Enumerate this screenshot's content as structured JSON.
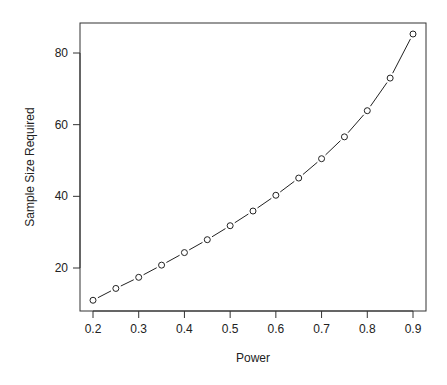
{
  "chart_data": {
    "type": "line",
    "title": "",
    "xlabel": "Power",
    "ylabel": "Sample Size Required",
    "x": [
      0.2,
      0.25,
      0.3,
      0.35,
      0.4,
      0.45,
      0.5,
      0.55,
      0.6,
      0.65,
      0.7,
      0.75,
      0.8,
      0.85,
      0.9
    ],
    "series": [
      {
        "name": "Sample Size Required",
        "values": [
          11.0,
          14.3,
          17.4,
          20.8,
          24.3,
          27.9,
          31.8,
          35.9,
          40.3,
          45.1,
          50.5,
          56.6,
          63.9,
          73.0,
          85.3
        ],
        "marker": "open-circle",
        "line": "solid"
      }
    ],
    "xticks": [
      0.2,
      0.3,
      0.4,
      0.5,
      0.6,
      0.7,
      0.8,
      0.9
    ],
    "xtick_labels": [
      "0.2",
      "0.3",
      "0.4",
      "0.5",
      "0.6",
      "0.7",
      "0.8",
      "0.9"
    ],
    "yticks": [
      20,
      40,
      60,
      80
    ],
    "ytick_labels": [
      "20",
      "40",
      "60",
      "80"
    ],
    "xlim": [
      0.172,
      0.928
    ],
    "ylim": [
      7.5,
      88.2
    ],
    "grid": false,
    "legend": null
  }
}
